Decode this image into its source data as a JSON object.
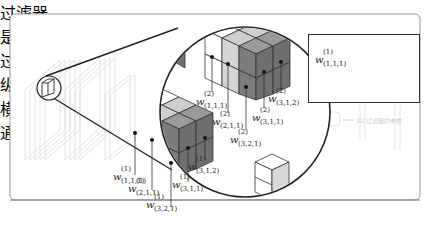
{
  "legend": {
    "title": "过滤器",
    "symbol": "w",
    "superscript": "(1)",
    "subscript": "(1,1,1)",
    "annotations": [
      {
        "key": "filter_index",
        "text": "是第几个"
      },
      {
        "key": "filter_index_2",
        "text": "过滤器"
      },
      {
        "key": "vertical",
        "text": "纵"
      },
      {
        "key": "horizontal",
        "text": "横"
      },
      {
        "key": "channel",
        "text": "通道"
      }
    ]
  },
  "filter1_labels": [
    {
      "sup": "(1)",
      "sub": "(1,1,1)"
    },
    {
      "sup": "(1)",
      "sub": "(2,1,1)"
    },
    {
      "sup": "(1)",
      "sub": "(3,2,1)"
    },
    {
      "sup": "(1)",
      "sub": "(3,1,1)"
    },
    {
      "sup": "(1)",
      "sub": "(3,1,2)"
    }
  ],
  "filter2_labels": [
    {
      "sup": "(2)",
      "sub": "(1,1,1)"
    },
    {
      "sup": "(2)",
      "sub": "(2,1,1)"
    },
    {
      "sup": "(2)",
      "sub": "(3,2,1)"
    },
    {
      "sup": "(2)",
      "sub": "(3,1,1)"
    },
    {
      "sup": "(2)",
      "sub": "(3,1,2)"
    }
  ],
  "faint_caption": "3D 过滤器的参数",
  "colors": {
    "white_face": "#ffffff",
    "light_face": "#d0d0d0",
    "dark_face": "#7a7a7a",
    "top_dark": "#9a9a9a",
    "outline": "#222222",
    "frame": "#888888"
  }
}
